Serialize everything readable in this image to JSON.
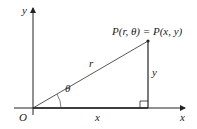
{
  "diagram": {
    "labels": {
      "y_axis": "y",
      "x_axis": "x",
      "origin": "O",
      "point": "P(r, θ) = P(x, y)",
      "radius": "r",
      "vertical_leg": "y",
      "horizontal_leg": "x",
      "angle": "θ"
    },
    "colors": {
      "stroke": "#222222",
      "background": "#ffffff"
    }
  }
}
